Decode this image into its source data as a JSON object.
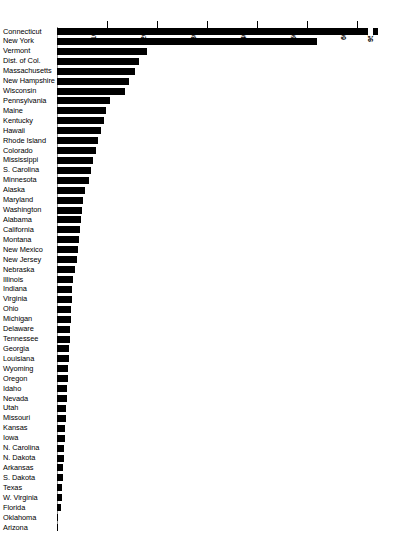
{
  "chart_data": {
    "type": "bar",
    "orientation": "horizontal",
    "title": "",
    "subtitle": "",
    "xlabel": "",
    "ylabel": "",
    "xlim": [
      0,
      650
    ],
    "grid": false,
    "legend": null,
    "axis_break": {
      "present": true,
      "value_label": "950",
      "applies_to": "Connecticut"
    },
    "xticks": [
      100,
      200,
      300,
      400,
      500,
      600
    ],
    "xtick_labels": [
      "100",
      "200",
      "300",
      "400",
      "500",
      "600"
    ],
    "extra_tick_labels": [
      "950"
    ],
    "categories": [
      "Connecticut",
      "New York",
      "Vermont",
      "Dist. of Col.",
      "Massachusetts",
      "New Hampshire",
      "Wisconsin",
      "Pennsylvania",
      "Maine",
      "Kentucky",
      "Hawaii",
      "Rhode Island",
      "Colorado",
      "Mississippi",
      "S. Carolina",
      "Minnesota",
      "Alaska",
      "Maryland",
      "Washington",
      "Alabama",
      "California",
      "Montana",
      "New Mexico",
      "New Jersey",
      "Nebraska",
      "Illinois",
      "Indiana",
      "Virginia",
      "Ohio",
      "Michigan",
      "Delaware",
      "Tennessee",
      "Georgia",
      "Louisiana",
      "Wyoming",
      "Oregon",
      "Idaho",
      "Nevada",
      "Utah",
      "Missouri",
      "Kansas",
      "Iowa",
      "N. Carolina",
      "N. Dakota",
      "Arkansas",
      "S. Dakota",
      "Texas",
      "W. Virginia",
      "Florida",
      "Oklahoma",
      "Arizona"
    ],
    "values": [
      950,
      520,
      180,
      163,
      155,
      143,
      135,
      105,
      97,
      94,
      87,
      82,
      78,
      72,
      68,
      63,
      55,
      52,
      50,
      48,
      45,
      43,
      41,
      39,
      36,
      32,
      30,
      29,
      28,
      27,
      26,
      25,
      24,
      23,
      22,
      21,
      20,
      19,
      18,
      17,
      16,
      15,
      14,
      13,
      12,
      11,
      10,
      9,
      8,
      2,
      1
    ]
  }
}
